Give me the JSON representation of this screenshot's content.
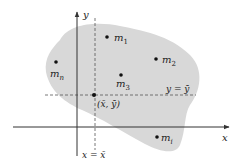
{
  "diagram": {
    "colors": {
      "region": "#d8d8d8",
      "axis": "#333333",
      "dashed": "#555555",
      "point": "#111111",
      "background": "#ffffff"
    },
    "axes": {
      "x_label": "x",
      "y_label": "y"
    },
    "guides": {
      "vertical_label": "x = x̄",
      "horizontal_label": "y = ȳ"
    },
    "points": [
      {
        "id": "m1",
        "base": "m",
        "sub": "1",
        "cx": 107,
        "cy": 37
      },
      {
        "id": "m2",
        "base": "m",
        "sub": "2",
        "cx": 156,
        "cy": 59
      },
      {
        "id": "m3",
        "base": "m",
        "sub": "3",
        "cx": 121,
        "cy": 75
      },
      {
        "id": "mn",
        "base": "m",
        "sub": "n",
        "cx": 56,
        "cy": 62
      },
      {
        "id": "mt",
        "base": "m",
        "sub": "i",
        "cx": 157,
        "cy": 137
      }
    ],
    "centroid": {
      "label": "(x̄, ȳ)",
      "cx": 94,
      "cy": 95
    }
  }
}
